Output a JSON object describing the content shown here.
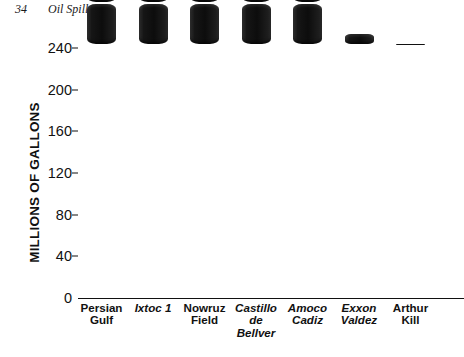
{
  "page": {
    "folio": "34",
    "running_head": "Oil Spills"
  },
  "chart_data": {
    "type": "bar",
    "title": "",
    "xlabel": "",
    "ylabel": "MILLIONS OF GALLONS",
    "ylim": [
      0,
      240
    ],
    "yticks": [
      0,
      40,
      80,
      120,
      160,
      200,
      240
    ],
    "ytick_labels": [
      "0",
      "40",
      "80",
      "120",
      "160",
      "200",
      "240"
    ],
    "grid": false,
    "legend": "none",
    "unit_per_segment": 40,
    "bar_style": "stacked-oil-drum-segments",
    "bar_color": "#111111",
    "categories": [
      "Persian Gulf",
      "Ixtoc 1",
      "Nowruz Field",
      "Castillo de Bellver",
      "Amoco Cadiz",
      "Exxon Valdez",
      "Arthur Kill"
    ],
    "category_lines": [
      [
        "Persian",
        "Gulf"
      ],
      [
        "Ixtoc 1"
      ],
      [
        "Nowruz",
        "Field"
      ],
      [
        "Castillo",
        "de",
        "Bellver"
      ],
      [
        "Amoco",
        "Cadiz"
      ],
      [
        "Exxon",
        "Valdez"
      ],
      [
        "Arthur",
        "Kill"
      ]
    ],
    "category_italic": [
      false,
      true,
      false,
      true,
      true,
      true,
      false
    ],
    "values": [
      240,
      140,
      80,
      80,
      70,
      11,
      2
    ]
  }
}
